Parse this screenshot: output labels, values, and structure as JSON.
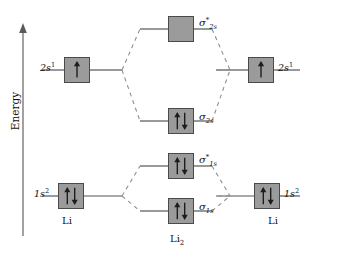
{
  "diagram": {
    "axis": {
      "label": "Energy",
      "direction": "up",
      "icon": "up-arrow-icon"
    },
    "colors": {
      "box_fill": "#9b9b9b",
      "box_border": "#4a4a4a",
      "line": "#555555",
      "dashed_line": "#8a8a8a",
      "text": "#111111",
      "background": "#ffffff"
    },
    "left_atom": {
      "name": "Li",
      "label": "Li",
      "levels": [
        {
          "id": "left-2s",
          "label_main": "2s",
          "label_sup": "1",
          "electrons": "up",
          "occupancy": 1
        },
        {
          "id": "left-1s",
          "label_main": "1s",
          "label_sup": "2",
          "electrons": "up-down",
          "occupancy": 2
        }
      ]
    },
    "right_atom": {
      "name": "Li",
      "label": "Li",
      "levels": [
        {
          "id": "right-2s",
          "label_main": "2s",
          "label_sup": "1",
          "electrons": "up",
          "occupancy": 1
        },
        {
          "id": "right-1s",
          "label_main": "1s",
          "label_sup": "2",
          "electrons": "up-down",
          "occupancy": 2
        }
      ]
    },
    "molecule": {
      "name": "Li2",
      "label": "Li",
      "label_sub": "2",
      "orbitals": [
        {
          "id": "sigma-2s-star",
          "symbol": "σ",
          "sub": "2s",
          "sup": "*",
          "type": "antibonding",
          "electrons": "none",
          "occupancy": 0
        },
        {
          "id": "sigma-2s",
          "symbol": "σ",
          "sub": "2s",
          "sup": "",
          "type": "bonding",
          "electrons": "up-down",
          "occupancy": 2
        },
        {
          "id": "sigma-1s-star",
          "symbol": "σ",
          "sub": "1s",
          "sup": "*",
          "type": "antibonding",
          "electrons": "up-down",
          "occupancy": 2
        },
        {
          "id": "sigma-1s",
          "symbol": "σ",
          "sub": "1s",
          "sup": "",
          "type": "bonding",
          "electrons": "up-down",
          "occupancy": 2
        }
      ]
    }
  }
}
